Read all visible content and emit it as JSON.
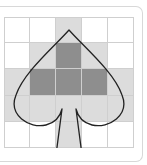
{
  "diagram": {
    "title": "",
    "rows": 5,
    "cols": 5,
    "cells": [
      [
        "white",
        "white",
        "light",
        "white",
        "white"
      ],
      [
        "white",
        "light",
        "dark",
        "light",
        "white"
      ],
      [
        "light",
        "dark",
        "dark",
        "dark",
        "light"
      ],
      [
        "light",
        "light",
        "light",
        "light",
        "light"
      ],
      [
        "white",
        "white",
        "light",
        "white",
        "white"
      ]
    ],
    "shape": "spade-outline",
    "colors": {
      "white": "#ffffff",
      "light": "#dcdcdc",
      "dark": "#8e8e8e",
      "outline": "#222222",
      "grid_line": "#cfcfcf"
    }
  }
}
